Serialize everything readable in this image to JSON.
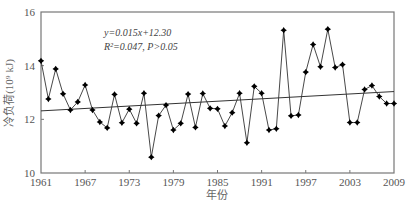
{
  "chart_data": {
    "type": "line",
    "title": "",
    "xlabel": "年份",
    "ylabel": "冷负荷(10⁹ kJ)",
    "ylabel_parts": {
      "main": "冷负荷(10",
      "sup": "9",
      "unit": " kJ)"
    },
    "xlim": [
      1961,
      2009
    ],
    "ylim": [
      10,
      16
    ],
    "x_ticks": [
      1961,
      1967,
      1973,
      1979,
      1985,
      1991,
      1997,
      2003,
      2009
    ],
    "y_ticks": [
      10,
      12,
      14,
      16
    ],
    "grid": false,
    "legend": null,
    "series": [
      {
        "name": "冷负荷",
        "marker": "star",
        "color": "#000000",
        "x": [
          1961,
          1962,
          1963,
          1964,
          1965,
          1966,
          1967,
          1968,
          1969,
          1970,
          1971,
          1972,
          1973,
          1974,
          1975,
          1976,
          1977,
          1978,
          1979,
          1980,
          1981,
          1982,
          1983,
          1984,
          1985,
          1986,
          1987,
          1988,
          1989,
          1990,
          1991,
          1992,
          1993,
          1994,
          1995,
          1996,
          1997,
          1998,
          1999,
          2000,
          2001,
          2002,
          2003,
          2004,
          2005,
          2006,
          2007,
          2008,
          2009
        ],
        "values": [
          14.18,
          12.76,
          13.88,
          12.95,
          12.35,
          12.65,
          13.28,
          12.35,
          11.9,
          11.68,
          12.93,
          11.87,
          12.38,
          11.85,
          12.97,
          10.59,
          12.14,
          12.53,
          11.6,
          11.85,
          12.94,
          11.7,
          12.96,
          12.41,
          12.39,
          11.75,
          12.25,
          12.97,
          11.13,
          13.23,
          12.97,
          11.6,
          11.65,
          15.32,
          12.13,
          12.16,
          13.76,
          14.79,
          13.96,
          15.36,
          13.93,
          14.04,
          11.88,
          11.88,
          13.11,
          13.26,
          12.85,
          12.59,
          12.59
        ]
      }
    ],
    "trendline": {
      "slope": 0.015,
      "intercept": 12.3,
      "x_index_start": 1,
      "color": "#333333"
    },
    "annotations": {
      "equation": "y=0.015x+12.30",
      "stats": "R²=0.047, P>0.05"
    }
  }
}
